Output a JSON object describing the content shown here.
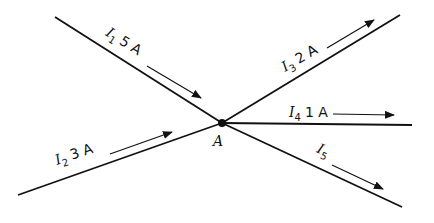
{
  "diagram": {
    "type": "kirchhoff-current-junction",
    "node": {
      "label": "A",
      "x": 222,
      "y": 123
    },
    "branches": [
      {
        "id": "I1",
        "symbol": "I",
        "sub": "1",
        "value": "5 A",
        "direction": "into"
      },
      {
        "id": "I2",
        "symbol": "I",
        "sub": "2",
        "value": "3 A",
        "direction": "into"
      },
      {
        "id": "I3",
        "symbol": "I",
        "sub": "3",
        "value": "2 A",
        "direction": "out"
      },
      {
        "id": "I4",
        "symbol": "I",
        "sub": "4",
        "value": "1 A",
        "direction": "out"
      },
      {
        "id": "I5",
        "symbol": "I",
        "sub": "5",
        "value": "",
        "direction": "out"
      }
    ],
    "colors": {
      "line": "#111111",
      "background": "#ffffff"
    }
  }
}
